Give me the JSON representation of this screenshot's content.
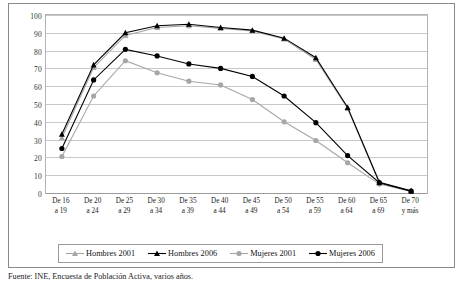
{
  "figure": {
    "caption": "Fuente: INE, Encuesta de Población Activa, varios años."
  },
  "legend": {
    "position": "bottom",
    "items": [
      {
        "label": "Hombres 2001",
        "color": "#a6a6a6",
        "marker": "triangle"
      },
      {
        "label": "Hombres 2006",
        "color": "#000000",
        "marker": "triangle"
      },
      {
        "label": "Mujeres 2001",
        "color": "#a6a6a6",
        "marker": "circle"
      },
      {
        "label": "Mujeres 2006",
        "color": "#000000",
        "marker": "circle"
      }
    ]
  },
  "chart_data": {
    "type": "line",
    "title": "",
    "subtitle": "",
    "xlabel": "",
    "ylabel": "",
    "ylim": [
      0,
      100
    ],
    "ytick_step": 10,
    "yticks": [
      0,
      10,
      20,
      30,
      40,
      50,
      60,
      70,
      80,
      90,
      100
    ],
    "grid": true,
    "categories": [
      "De 16 a 19",
      "De 20 a 24",
      "De 25 a 29",
      "De 30 a 34",
      "De 35 a 39",
      "De 40 a 44",
      "De 45 a 49",
      "De 50 a 54",
      "De 55 a 59",
      "De 60 a 64",
      "De 65 a 69",
      "De 70 y más"
    ],
    "categories_lines": [
      [
        "De 16",
        "a 19"
      ],
      [
        "De 20",
        "a 24"
      ],
      [
        "De 25",
        "a 29"
      ],
      [
        "De 30",
        "a 34"
      ],
      [
        "De 35",
        "a 39"
      ],
      [
        "De 40",
        "a 44"
      ],
      [
        "De 45",
        "a 49"
      ],
      [
        "De 50",
        "a 54"
      ],
      [
        "De 55",
        "a 59"
      ],
      [
        "De 60",
        "a 64"
      ],
      [
        "De 65",
        "a 69"
      ],
      [
        "De 70",
        "y más"
      ]
    ],
    "series": [
      {
        "name": "Hombres 2001",
        "color": "#a6a6a6",
        "marker": "triangle",
        "values": [
          31.0,
          70.5,
          88.5,
          93.0,
          94.0,
          92.5,
          91.0,
          86.5,
          75.0,
          47.5,
          5.5,
          1.0
        ]
      },
      {
        "name": "Hombres 2006",
        "color": "#000000",
        "marker": "triangle",
        "values": [
          33.0,
          72.0,
          90.0,
          94.0,
          94.8,
          93.0,
          91.5,
          87.0,
          76.0,
          48.0,
          6.0,
          1.2
        ]
      },
      {
        "name": "Mujeres 2001",
        "color": "#a6a6a6",
        "marker": "circle",
        "values": [
          20.5,
          54.5,
          74.3,
          67.5,
          62.8,
          60.7,
          52.5,
          40.0,
          29.5,
          17.0,
          5.0,
          0.8
        ]
      },
      {
        "name": "Mujeres 2006",
        "color": "#000000",
        "marker": "circle",
        "values": [
          25.0,
          63.5,
          80.7,
          77.0,
          72.5,
          70.0,
          65.5,
          54.5,
          39.5,
          21.0,
          5.8,
          1.0
        ]
      }
    ]
  }
}
